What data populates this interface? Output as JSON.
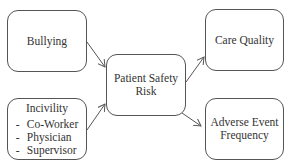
{
  "diagram": {
    "nodes": {
      "bullying": {
        "label": "Bullying"
      },
      "incivility": {
        "label": "Incivility",
        "items": [
          {
            "dash": "-",
            "text": "Co-Worker"
          },
          {
            "dash": "-",
            "text": "Physician"
          },
          {
            "dash": "-",
            "text": "Supervisor"
          }
        ]
      },
      "patient_safety_risk": {
        "line1": "Patient Safety",
        "line2": "Risk"
      },
      "care_quality": {
        "label": "Care Quality"
      },
      "adverse_event_frequency": {
        "line1": "Adverse Event",
        "line2": "Frequency"
      }
    },
    "edges": [
      {
        "from": "Bullying",
        "to": "Patient Safety Risk"
      },
      {
        "from": "Incivility",
        "to": "Patient Safety Risk"
      },
      {
        "from": "Patient Safety Risk",
        "to": "Care Quality"
      },
      {
        "from": "Patient Safety Risk",
        "to": "Adverse Event Frequency"
      }
    ],
    "colors": {
      "stroke": "#555555",
      "text": "#333333",
      "background": "#ffffff"
    }
  }
}
